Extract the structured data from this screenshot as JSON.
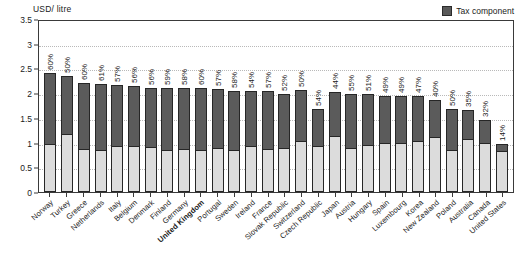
{
  "legend": {
    "label": "Tax component",
    "swatch_color": "#5b5b5b",
    "base_color": "#dcdcdc"
  },
  "axis": {
    "y_title": "USD/ litre",
    "y_ticks": [
      "0",
      "0.5",
      "1",
      "1.5",
      "2",
      "2.5",
      "3",
      "3.5"
    ]
  },
  "chart_data": {
    "type": "bar",
    "subtype": "stacked-bar",
    "title": "",
    "xlabel": "",
    "ylabel": "USD/ litre",
    "ylim": [
      0,
      3.5
    ],
    "ytick_step": 0.5,
    "grid": true,
    "legend_position": "top-right",
    "categories": [
      "Norway",
      "Turkey",
      "Greece",
      "Netherlands",
      "Italy",
      "Belgium",
      "Denmark",
      "Finland",
      "Germany",
      "United Kingdom",
      "Portugal",
      "Sweden",
      "Ireland",
      "France",
      "Slovak Republic",
      "Switzerland",
      "Czech Republic",
      "Japan",
      "Austria",
      "Hungary",
      "Spain",
      "Luxembourg",
      "Korea",
      "New Zealand",
      "Poland",
      "Australia",
      "Canada",
      "United States"
    ],
    "highlight_category": "United Kingdom",
    "series": [
      {
        "name": "Pre-tax component",
        "color": "#dcdcdc",
        "values": [
          0.97,
          1.17,
          0.88,
          0.85,
          0.93,
          0.94,
          0.92,
          0.86,
          0.88,
          0.84,
          0.9,
          0.86,
          0.94,
          0.88,
          0.9,
          1.03,
          0.94,
          1.13,
          0.89,
          0.96,
          0.99,
          0.99,
          1.03,
          1.12,
          0.84,
          1.08,
          0.99,
          0.83
        ]
      },
      {
        "name": "Tax component",
        "color": "#5b5b5b",
        "values": [
          1.43,
          1.17,
          1.32,
          1.33,
          1.23,
          1.2,
          1.18,
          1.24,
          1.22,
          1.26,
          1.18,
          1.18,
          1.11,
          1.17,
          1.08,
          1.03,
          0.74,
          0.89,
          1.09,
          1.03,
          0.95,
          0.95,
          0.91,
          0.75,
          0.84,
          0.58,
          0.47,
          0.14
        ]
      }
    ],
    "totals": [
      2.4,
      2.34,
      2.2,
      2.18,
      2.16,
      2.14,
      2.1,
      2.1,
      2.1,
      2.1,
      2.08,
      2.04,
      2.05,
      2.05,
      1.98,
      2.06,
      1.68,
      2.02,
      1.98,
      1.99,
      1.94,
      1.94,
      1.94,
      1.87,
      1.68,
      1.66,
      1.46,
      0.97
    ],
    "tax_share_labels": [
      "60%",
      "50%",
      "60%",
      "61%",
      "57%",
      "56%",
      "56%",
      "59%",
      "58%",
      "60%",
      "57%",
      "58%",
      "54%",
      "57%",
      "52%",
      "50%",
      "54%",
      "44%",
      "55%",
      "51%",
      "49%",
      "49%",
      "47%",
      "40%",
      "50%",
      "35%",
      "32%",
      "14%"
    ]
  }
}
